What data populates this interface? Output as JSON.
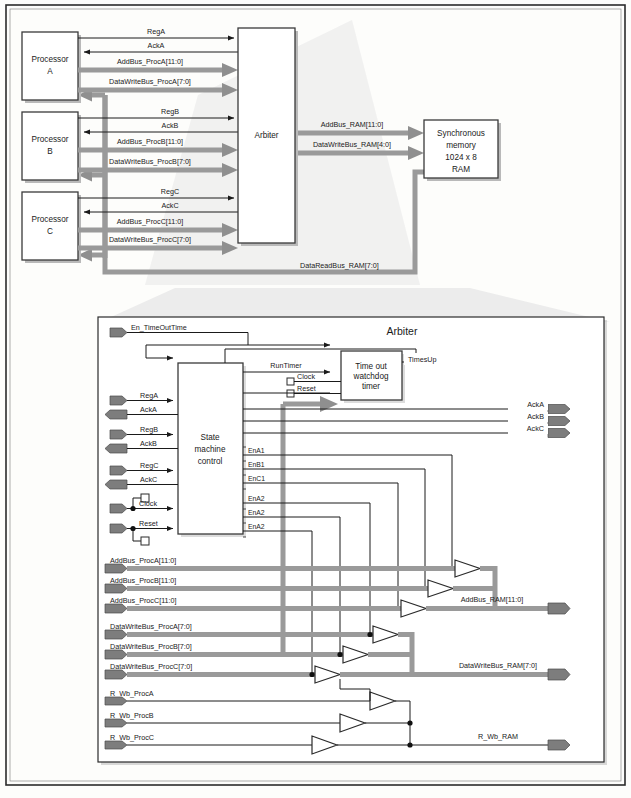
{
  "figure": {
    "colors": {
      "bus_gray": "#9a9a9a",
      "wire_black": "#1a1a1a",
      "pin_gray": "#7d7d7d",
      "fan_gray": "#ececec",
      "panel_border": "#2b2b2b"
    }
  },
  "top_panel": {
    "processors": [
      {
        "id": "A",
        "line1": "Processor",
        "line2": "A"
      },
      {
        "id": "B",
        "line1": "Processor",
        "line2": "B"
      },
      {
        "id": "C",
        "line1": "Processor",
        "line2": "C"
      }
    ],
    "arbiter_label": "Arbiter",
    "memory": {
      "line1": "Synchronous",
      "line2": "memory",
      "line3": "1024 x 8",
      "line4": "RAM"
    },
    "signals_a": [
      {
        "name": "ReqA",
        "label": "RegA",
        "kind": "wire",
        "dir": "to-arbiter"
      },
      {
        "name": "AckA",
        "label": "AckA",
        "kind": "wire",
        "dir": "to-processor"
      },
      {
        "name": "AddBusA",
        "label": "AddBus_ProcA[11:0]",
        "kind": "bus",
        "dir": "to-arbiter"
      },
      {
        "name": "DataWriteBusA",
        "label": "DataWriteBus_ProcA[7:0]",
        "kind": "bus",
        "dir": "to-arbiter"
      }
    ],
    "signals_b": [
      {
        "name": "ReqB",
        "label": "RegB",
        "kind": "wire",
        "dir": "to-arbiter"
      },
      {
        "name": "AckB",
        "label": "AckB",
        "kind": "wire",
        "dir": "to-processor"
      },
      {
        "name": "AddBusB",
        "label": "AddBus_ProcB[11:0]",
        "kind": "bus",
        "dir": "to-arbiter"
      },
      {
        "name": "DataWriteBusB",
        "label": "DataWriteBus_ProcB[7:0]",
        "kind": "bus",
        "dir": "to-arbiter"
      }
    ],
    "signals_c": [
      {
        "name": "ReqC",
        "label": "RegC",
        "kind": "wire",
        "dir": "to-arbiter"
      },
      {
        "name": "AckC",
        "label": "AckC",
        "kind": "wire",
        "dir": "to-processor"
      },
      {
        "name": "AddBusC",
        "label": "AddBus_ProcC[11:0]",
        "kind": "bus",
        "dir": "to-arbiter"
      },
      {
        "name": "DataWriteBusC",
        "label": "DataWriteBus_ProcC[7:0]",
        "kind": "bus",
        "dir": "to-arbiter"
      }
    ],
    "memory_signals": [
      {
        "name": "AddBusRAM",
        "label": "AddBus_RAM[11:0]",
        "kind": "bus",
        "dir": "to-memory"
      },
      {
        "name": "DataWriteBusRAM",
        "label": "DataWriteBus_RAM[4:0]",
        "kind": "bus",
        "dir": "to-memory"
      },
      {
        "name": "DataReadBusRAM",
        "label": "DataReadBus_RAM[7:0]",
        "kind": "bus",
        "dir": "to-processors"
      }
    ]
  },
  "arbiter_panel": {
    "title": "Arbiter",
    "state_machine": {
      "line1": "State",
      "line2": "machine",
      "line3": "control"
    },
    "timer": {
      "line1": "Time out",
      "line2": "watchdog",
      "line3": "timer"
    },
    "internal_signals": {
      "en_timeout": "En_TimeOutTime",
      "run_timer": "RunTimer",
      "times_up": "TimesUp",
      "clock_timer": "Clock",
      "reset_timer": "Reset"
    },
    "left_inputs": [
      {
        "name": "en-timeouttime",
        "label": "En_TimeOutTime",
        "kind": "wire",
        "y": 332
      },
      {
        "name": "req-a",
        "label": "RegA",
        "kind": "wire",
        "y": 400
      },
      {
        "name": "ack-a",
        "label": "AckA",
        "kind": "wire-out",
        "y": 414
      },
      {
        "name": "req-b",
        "label": "RegB",
        "kind": "wire",
        "y": 434
      },
      {
        "name": "ack-b",
        "label": "AckB",
        "kind": "wire-out",
        "y": 448
      },
      {
        "name": "req-c",
        "label": "RegC",
        "kind": "wire",
        "y": 470
      },
      {
        "name": "ack-c",
        "label": "AckC",
        "kind": "wire-out",
        "y": 484
      },
      {
        "name": "clock",
        "label": "Clock",
        "kind": "wire",
        "y": 508
      },
      {
        "name": "reset",
        "label": "Reset",
        "kind": "wire",
        "y": 528
      },
      {
        "name": "addbus-proca",
        "label": "AddBus_ProcA[11:0]",
        "kind": "bus",
        "y": 568
      },
      {
        "name": "addbus-procb",
        "label": "AddBus_ProcB[11:0]",
        "kind": "bus",
        "y": 588
      },
      {
        "name": "addbus-procc",
        "label": "AddBus_ProcC[11:0]",
        "kind": "bus",
        "y": 608
      },
      {
        "name": "datawritebus-proca",
        "label": "DataWriteBus_ProcA[7:0]",
        "kind": "bus",
        "y": 634
      },
      {
        "name": "datawritebus-procb",
        "label": "DataWriteBus_ProcB[7:0]",
        "kind": "bus",
        "y": 654
      },
      {
        "name": "datawritebus-procc",
        "label": "DataWriteBus_ProcC[7:0]",
        "kind": "bus",
        "y": 674
      },
      {
        "name": "r-wb-proca",
        "label": "R_Wb_ProcA",
        "kind": "wire",
        "y": 700
      },
      {
        "name": "r-wb-procb",
        "label": "R_Wb_ProcB",
        "kind": "wire",
        "y": 722
      },
      {
        "name": "r-wb-procc",
        "label": "R_Wb_ProcC",
        "kind": "wire",
        "y": 744
      }
    ],
    "right_outputs": [
      {
        "name": "ack-a-out",
        "label": "AckA",
        "kind": "wire",
        "y": 409
      },
      {
        "name": "ack-b-out",
        "label": "AckB",
        "kind": "wire",
        "y": 421
      },
      {
        "name": "ack-c-out",
        "label": "AckC",
        "kind": "wire",
        "y": 433
      },
      {
        "name": "addbus-ram-out",
        "label": "AddBus_RAM[11:0]",
        "kind": "bus",
        "y": 608
      },
      {
        "name": "datawritebus-ram-out",
        "label": "DataWriteBus_RAM[7:0]",
        "kind": "bus",
        "y": 673
      },
      {
        "name": "r-wb-ram-out",
        "label": "R_Wb_RAM",
        "kind": "wire",
        "y": 744
      }
    ],
    "enable_signals": [
      {
        "name": "ena1",
        "label": "EnA1",
        "y": 455
      },
      {
        "name": "enb1",
        "label": "EnB1",
        "y": 469
      },
      {
        "name": "enc1",
        "label": "EnC1",
        "y": 483
      },
      {
        "name": "ena2-1",
        "label": "EnA2",
        "y": 503
      },
      {
        "name": "ena2-2",
        "label": "EnA2",
        "y": 517
      },
      {
        "name": "ena2-3",
        "label": "EnA2",
        "y": 531
      }
    ]
  }
}
